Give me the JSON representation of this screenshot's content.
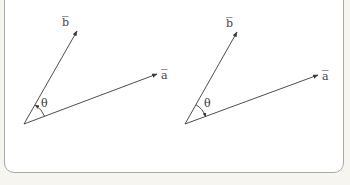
{
  "figure": {
    "background_color": "#f7f5ef",
    "card_color": "#ffffff",
    "border_color": "#a9a9a9",
    "stroke_color": "#3a3a3a"
  },
  "panels": [
    {
      "id": "left",
      "vector_a_label": "a",
      "vector_b_label": "b",
      "angle_label": "θ",
      "angle_direction": "from a to b (counterclockwise), arrowhead on b"
    },
    {
      "id": "right",
      "vector_a_label": "a",
      "vector_b_label": "b",
      "angle_label": "θ",
      "angle_direction": "from b to a (clockwise), arrowhead on a"
    }
  ]
}
